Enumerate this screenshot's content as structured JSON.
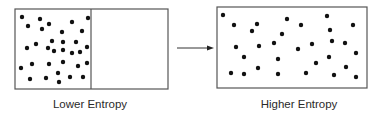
{
  "diagram": {
    "left_panel": {
      "label": "Lower Entropy",
      "box": {
        "x": 15,
        "y": 9,
        "w": 153,
        "h": 80
      },
      "divider_x": 91,
      "dots": [
        [
          22,
          17
        ],
        [
          40,
          19
        ],
        [
          88,
          18
        ],
        [
          28,
          26
        ],
        [
          49,
          24
        ],
        [
          42,
          29
        ],
        [
          72,
          22
        ],
        [
          82,
          31
        ],
        [
          62,
          32
        ],
        [
          52,
          41
        ],
        [
          63,
          42
        ],
        [
          76,
          42
        ],
        [
          36,
          44
        ],
        [
          27,
          48
        ],
        [
          48,
          48
        ],
        [
          54,
          51
        ],
        [
          63,
          50
        ],
        [
          72,
          53
        ],
        [
          80,
          52
        ],
        [
          87,
          47
        ],
        [
          21,
          68
        ],
        [
          32,
          64
        ],
        [
          49,
          64
        ],
        [
          63,
          62
        ],
        [
          78,
          66
        ],
        [
          87,
          63
        ],
        [
          30,
          79
        ],
        [
          46,
          78
        ],
        [
          58,
          73
        ],
        [
          59,
          82
        ],
        [
          70,
          77
        ],
        [
          83,
          77
        ]
      ]
    },
    "arrow": {
      "x1": 177,
      "y": 48,
      "x2": 214
    },
    "right_panel": {
      "label": "Higher Entropy",
      "box": {
        "x": 217,
        "y": 7,
        "w": 150,
        "h": 81
      },
      "dots": [
        [
          223,
          15
        ],
        [
          234,
          25
        ],
        [
          257,
          24
        ],
        [
          252,
          31
        ],
        [
          287,
          19
        ],
        [
          301,
          25
        ],
        [
          327,
          16
        ],
        [
          330,
          30
        ],
        [
          353,
          25
        ],
        [
          282,
          34
        ],
        [
          236,
          47
        ],
        [
          259,
          46
        ],
        [
          274,
          43
        ],
        [
          298,
          49
        ],
        [
          312,
          44
        ],
        [
          332,
          41
        ],
        [
          345,
          43
        ],
        [
          356,
          53
        ],
        [
          244,
          57
        ],
        [
          278,
          59
        ],
        [
          329,
          57
        ],
        [
          316,
          63
        ],
        [
          258,
          68
        ],
        [
          346,
          67
        ],
        [
          231,
          73
        ],
        [
          244,
          74
        ],
        [
          278,
          74
        ],
        [
          306,
          73
        ],
        [
          334,
          75
        ],
        [
          356,
          77
        ]
      ]
    },
    "colors": {
      "stroke": "#555555",
      "dot": "#111111"
    }
  }
}
